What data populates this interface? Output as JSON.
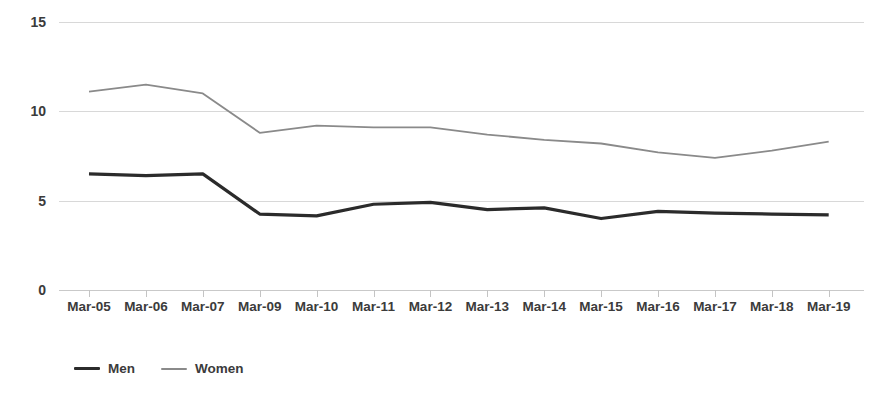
{
  "chart_data": {
    "type": "line",
    "title": "",
    "subtitle": "",
    "xlabel": "",
    "ylabel": "",
    "ylim": [
      0,
      15
    ],
    "y_ticks": [
      0,
      5,
      10,
      15
    ],
    "y_tick_labels": [
      "0",
      "5",
      "10",
      "15"
    ],
    "grid": "horizontal",
    "legend_position": "bottom-left",
    "categories": [
      "Mar-05",
      "Mar-06",
      "Mar-07",
      "Mar-09",
      "Mar-10",
      "Mar-11",
      "Mar-12",
      "Mar-13",
      "Mar-14",
      "Mar-15",
      "Mar-16",
      "Mar-17",
      "Mar-18",
      "Mar-19"
    ],
    "series": [
      {
        "name": "Men",
        "color": "#2b2b2b",
        "line_width": 3.2,
        "values": [
          6.5,
          6.4,
          6.5,
          4.25,
          4.15,
          4.8,
          4.9,
          4.5,
          4.6,
          4.0,
          4.4,
          4.3,
          4.25,
          4.2
        ]
      },
      {
        "name": "Women",
        "color": "#8a8a8a",
        "line_width": 1.8,
        "values": [
          11.1,
          11.5,
          11.0,
          8.8,
          9.2,
          9.1,
          9.1,
          8.7,
          8.4,
          8.2,
          7.7,
          7.4,
          7.8,
          8.3
        ]
      }
    ]
  },
  "legend": {
    "items": [
      {
        "label": "Men"
      },
      {
        "label": "Women"
      }
    ]
  },
  "colors": {
    "men": "#2b2b2b",
    "women": "#8a8a8a",
    "gridline": "#d8d8d8",
    "axis": "#c9c9c9",
    "text": "#3b3b3b",
    "background": "#ffffff"
  }
}
